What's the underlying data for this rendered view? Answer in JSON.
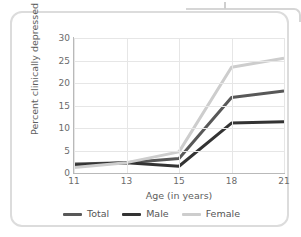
{
  "card": {
    "border_color": "#dcdcdc",
    "background": "#ffffff"
  },
  "chart_data": {
    "type": "line",
    "title": "",
    "subtitle": "",
    "xlabel": "Age (in years)",
    "ylabel": "Percent clinically depressed",
    "categories": [
      "11",
      "13",
      "15",
      "18",
      "21"
    ],
    "x": [
      11,
      13,
      15,
      18,
      21
    ],
    "xtick_labels": [
      "11",
      "13",
      "15",
      "18",
      "21"
    ],
    "ytick_labels": [
      "0",
      "5",
      "10",
      "15",
      "20",
      "25",
      "30"
    ],
    "yticks": [
      0,
      5,
      10,
      15,
      20,
      25,
      30
    ],
    "ylim": [
      0,
      30
    ],
    "grid": true,
    "legend_position": "bottom",
    "series": [
      {
        "name": "Total",
        "color": "#585858",
        "width": 3,
        "values": [
          2.0,
          2.3,
          3.2,
          16.8,
          18.2
        ]
      },
      {
        "name": "Male",
        "color": "#333333",
        "width": 3,
        "values": [
          1.8,
          2.3,
          1.5,
          11.1,
          11.4
        ]
      },
      {
        "name": "Female",
        "color": "#cdcdcd",
        "width": 3,
        "values": [
          1.2,
          2.3,
          4.7,
          23.5,
          25.5
        ]
      }
    ]
  },
  "legend": {
    "items": [
      {
        "label": "Total",
        "color": "#585858"
      },
      {
        "label": "Male",
        "color": "#333333"
      },
      {
        "label": "Female",
        "color": "#cdcdcd"
      }
    ]
  }
}
